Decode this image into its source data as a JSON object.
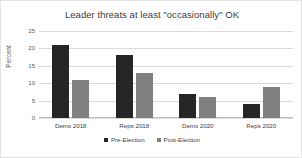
{
  "chart_data": {
    "type": "bar",
    "title": "Leader threats at least \"occasionally\" OK",
    "xlabel": "",
    "ylabel": "Percent",
    "ylim": [
      0,
      25
    ],
    "yticks": [
      0,
      5,
      10,
      15,
      20,
      25
    ],
    "grid": true,
    "legend_position": "bottom",
    "categories": [
      "Dems 2018",
      "Reps 2018",
      "Dems 2020",
      "Reps 2020"
    ],
    "series": [
      {
        "name": "Pre-Election",
        "color": "#262626",
        "values": [
          21,
          18,
          7,
          4
        ]
      },
      {
        "name": "Post-Election",
        "color": "#808080",
        "values": [
          11,
          13,
          6,
          9
        ]
      }
    ]
  }
}
